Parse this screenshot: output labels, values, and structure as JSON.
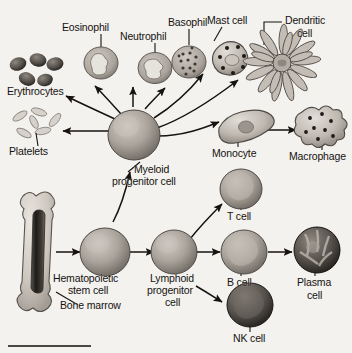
{
  "diagram": {
    "background_color": "#f3f2ef",
    "ink_color": "#16120f",
    "cell_fill_gray": "#9a948d",
    "cell_fill_light": "#cfcac3",
    "footer_rule": true
  },
  "labels": {
    "erythrocytes": "Erythrocytes",
    "platelets": "Platelets",
    "eosinophil": "Eosinophil",
    "neutrophil": "Neutrophil",
    "basophil": "Basophil",
    "mast_cell": "Mast cell",
    "dendritic_cell_line1": "Dendritic",
    "dendritic_cell_line2": "cell",
    "monocyte": "Monocyte",
    "macrophage": "Macrophage",
    "myeloid_line1": "Myeloid",
    "myeloid_line2": "progenitor cell",
    "hematopoietic_line1": "Hematopoietic",
    "hematopoietic_line2": "stem cell",
    "bone_marrow": "Bone marrow",
    "lymphoid_line1": "Lymphoid",
    "lymphoid_line2": "progenitor",
    "lymphoid_line3": "cell",
    "t_cell": "T cell",
    "b_cell": "B cell",
    "nk_cell": "NK cell",
    "plasma_line1": "Plasma",
    "plasma_line2": "cell"
  },
  "lineage": {
    "root": "Bone marrow",
    "nodes": [
      {
        "id": "bone-marrow",
        "label": "Bone marrow",
        "type": "tissue"
      },
      {
        "id": "hematopoietic-stem-cell",
        "label": "Hematopoietic stem cell",
        "type": "stem"
      },
      {
        "id": "myeloid-progenitor-cell",
        "label": "Myeloid progenitor cell",
        "type": "progenitor"
      },
      {
        "id": "lymphoid-progenitor-cell",
        "label": "Lymphoid progenitor cell",
        "type": "progenitor"
      },
      {
        "id": "erythrocytes",
        "label": "Erythrocytes",
        "type": "cell"
      },
      {
        "id": "platelets",
        "label": "Platelets",
        "type": "cell"
      },
      {
        "id": "eosinophil",
        "label": "Eosinophil",
        "type": "cell"
      },
      {
        "id": "neutrophil",
        "label": "Neutrophil",
        "type": "cell"
      },
      {
        "id": "basophil",
        "label": "Basophil",
        "type": "cell"
      },
      {
        "id": "mast-cell",
        "label": "Mast cell",
        "type": "cell"
      },
      {
        "id": "monocyte",
        "label": "Monocyte",
        "type": "cell"
      },
      {
        "id": "dendritic-cell",
        "label": "Dendritic cell",
        "type": "cell"
      },
      {
        "id": "macrophage",
        "label": "Macrophage",
        "type": "cell"
      },
      {
        "id": "t-cell",
        "label": "T cell",
        "type": "cell"
      },
      {
        "id": "b-cell",
        "label": "B cell",
        "type": "cell"
      },
      {
        "id": "nk-cell",
        "label": "NK cell",
        "type": "cell"
      },
      {
        "id": "plasma-cell",
        "label": "Plasma cell",
        "type": "cell"
      }
    ],
    "edges": [
      {
        "from": "bone-marrow",
        "to": "hematopoietic-stem-cell"
      },
      {
        "from": "hematopoietic-stem-cell",
        "to": "myeloid-progenitor-cell"
      },
      {
        "from": "hematopoietic-stem-cell",
        "to": "lymphoid-progenitor-cell"
      },
      {
        "from": "myeloid-progenitor-cell",
        "to": "erythrocytes"
      },
      {
        "from": "myeloid-progenitor-cell",
        "to": "platelets"
      },
      {
        "from": "myeloid-progenitor-cell",
        "to": "eosinophil"
      },
      {
        "from": "myeloid-progenitor-cell",
        "to": "neutrophil"
      },
      {
        "from": "myeloid-progenitor-cell",
        "to": "basophil"
      },
      {
        "from": "myeloid-progenitor-cell",
        "to": "mast-cell"
      },
      {
        "from": "myeloid-progenitor-cell",
        "to": "monocyte"
      },
      {
        "from": "myeloid-progenitor-cell",
        "to": "dendritic-cell"
      },
      {
        "from": "monocyte",
        "to": "macrophage"
      },
      {
        "from": "lymphoid-progenitor-cell",
        "to": "t-cell"
      },
      {
        "from": "lymphoid-progenitor-cell",
        "to": "b-cell"
      },
      {
        "from": "lymphoid-progenitor-cell",
        "to": "nk-cell"
      },
      {
        "from": "b-cell",
        "to": "plasma-cell"
      }
    ]
  }
}
